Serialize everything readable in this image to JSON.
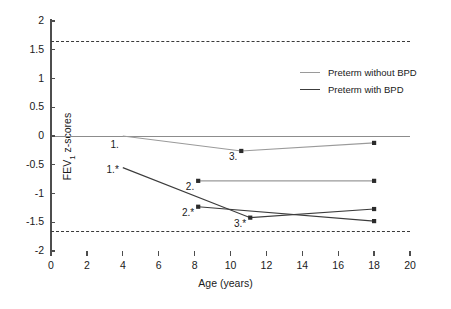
{
  "chart_data": {
    "type": "line",
    "title": "",
    "xlabel": "Age (years)",
    "ylabel": "FEV1 z-scores",
    "ylabel_base": "FEV",
    "ylabel_sub": "1",
    "ylabel_tail": " z-scores",
    "xlim": [
      0,
      20
    ],
    "ylim": [
      -2,
      2
    ],
    "xticks": [
      0,
      2,
      4,
      6,
      8,
      10,
      12,
      14,
      16,
      18,
      20
    ],
    "xtick_labels": [
      "0",
      "2",
      "4",
      "6",
      "8",
      "10",
      "12",
      "14",
      "16",
      "18",
      "20"
    ],
    "yticks": [
      2,
      1.5,
      1,
      0.5,
      0,
      -0.5,
      -1,
      -1.5,
      -2
    ],
    "ytick_labels": [
      "2",
      "1.5",
      "1",
      "0.5",
      "0",
      "-0.5",
      "-1",
      "-1.5",
      "-2"
    ],
    "grid": false,
    "legend_position": "upper right",
    "reference_lines": [
      {
        "name": "upper-limit-of-normal",
        "y": 1.64,
        "style": "dashed",
        "color": "#3a3a3a"
      },
      {
        "name": "lower-limit-of-normal",
        "y": -1.64,
        "style": "dashed",
        "color": "#3a3a3a"
      },
      {
        "name": "zero-line",
        "y": 0,
        "style": "solid",
        "color": "#8c8c8c"
      }
    ],
    "series": [
      {
        "name": "Preterm without BPD",
        "key": "without-bpd",
        "color": "#9a9a9a",
        "tracks": [
          {
            "track_id": "without-bpd-track-1",
            "points": [
              {
                "x": 4.0,
                "y": 0.0,
                "label": "1.",
                "marker": false
              },
              {
                "x": 10.6,
                "y": -0.26,
                "label": "3.",
                "marker": true
              },
              {
                "x": 18.0,
                "y": -0.12,
                "label": "",
                "marker": true
              }
            ]
          },
          {
            "track_id": "without-bpd-track-2",
            "points": [
              {
                "x": 8.2,
                "y": -0.78,
                "label": "2.",
                "marker": true
              },
              {
                "x": 18.0,
                "y": -0.78,
                "label": "",
                "marker": true
              }
            ]
          }
        ]
      },
      {
        "name": "Preterm with BPD",
        "key": "with-bpd",
        "color": "#3c3c3c",
        "tracks": [
          {
            "track_id": "with-bpd-track-1",
            "points": [
              {
                "x": 4.0,
                "y": -0.55,
                "label": "1.*",
                "marker": false
              },
              {
                "x": 11.1,
                "y": -1.42,
                "label": "3.*",
                "marker": true
              },
              {
                "x": 18.0,
                "y": -1.27,
                "label": "",
                "marker": true
              }
            ]
          },
          {
            "track_id": "with-bpd-track-2",
            "points": [
              {
                "x": 8.2,
                "y": -1.23,
                "label": "2.*",
                "marker": true
              },
              {
                "x": 18.0,
                "y": -1.48,
                "label": "",
                "marker": true
              }
            ]
          }
        ]
      }
    ],
    "annotations": [
      {
        "text": "1.",
        "x": 4.0,
        "y": 0.0,
        "series": "without-bpd"
      },
      {
        "text": "3.",
        "x": 10.6,
        "y": -0.26,
        "series": "without-bpd"
      },
      {
        "text": "2.",
        "x": 8.2,
        "y": -0.78,
        "series": "without-bpd"
      },
      {
        "text": "1.*",
        "x": 4.0,
        "y": -0.55,
        "series": "with-bpd"
      },
      {
        "text": "2.*",
        "x": 8.2,
        "y": -1.23,
        "series": "with-bpd"
      },
      {
        "text": "3.*",
        "x": 11.1,
        "y": -1.42,
        "series": "with-bpd"
      }
    ],
    "legend": [
      {
        "label": "Preterm without BPD",
        "color": "#9a9a9a"
      },
      {
        "label": "Preterm with BPD",
        "color": "#3c3c3c"
      }
    ]
  },
  "caption": {
    "text": ""
  }
}
